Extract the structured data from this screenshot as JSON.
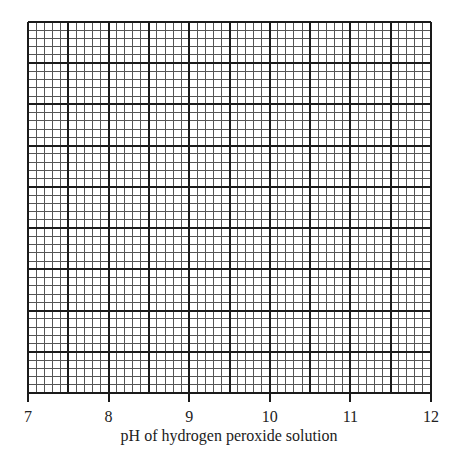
{
  "chart_data": {
    "type": "line",
    "title": "",
    "xlabel": "pH of hydrogen peroxide solution",
    "ylabel": "",
    "xlim": [
      7,
      12
    ],
    "x_ticks": [
      "7",
      "8",
      "9",
      "10",
      "11",
      "12"
    ],
    "y_ticks": [],
    "series": [],
    "grid": {
      "on": true,
      "major_columns": 10,
      "major_rows": 9,
      "minor_per_major": 5,
      "style": "graph paper"
    },
    "legend": null
  },
  "colors": {
    "major_line": "#1a1a1a",
    "minor_line": "#555555",
    "background": "#ffffff"
  }
}
